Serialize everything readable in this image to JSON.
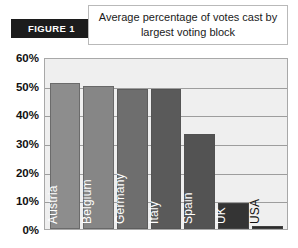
{
  "header": {
    "figure_badge": "FIGURE 1",
    "title": "Average percentage of votes cast by largest voting block"
  },
  "chart_data": {
    "type": "bar",
    "title": "Average percentage of votes cast by largest voting block",
    "xlabel": "",
    "ylabel": "",
    "ylim": [
      0,
      60
    ],
    "ytick_labels": [
      "0%",
      "10%",
      "20%",
      "30%",
      "40%",
      "50%",
      "60%"
    ],
    "yticks": [
      0,
      10,
      20,
      30,
      40,
      50,
      60
    ],
    "grid": true,
    "legend": "none",
    "categories": [
      "Austria",
      "Belgium",
      "Germany",
      "Italy",
      "Spain",
      "UK",
      "USA"
    ],
    "values": [
      51,
      50,
      49,
      49,
      33,
      9,
      1
    ],
    "bar_colors": [
      "#8d8d8d",
      "#868686",
      "#6e6e6e",
      "#5a5a5a",
      "#535353",
      "#343434",
      "#2b2b2b"
    ],
    "label_placement": [
      "inside",
      "inside",
      "inside",
      "inside",
      "inside",
      "inside",
      "outside"
    ],
    "plot_background": "#efefef",
    "gridline_color": "#9d9d9d",
    "axis_color": "#a8a8a8"
  }
}
